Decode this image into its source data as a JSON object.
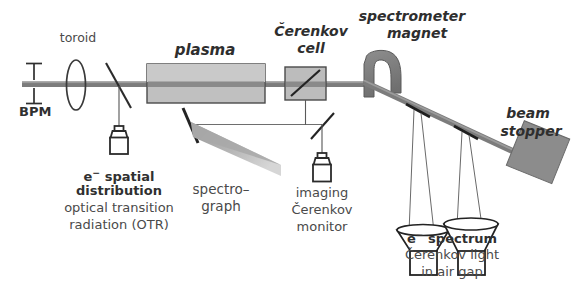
{
  "diagram": {
    "type": "schematic",
    "background_color": "#ffffff",
    "beamline_color": "#7a7a7a",
    "component_fill": "#b9b9b9",
    "outline_color": "#3a3a3a",
    "text_color": "#3b3b3b"
  },
  "labels": {
    "toroid": "toroid",
    "bpm": "BPM",
    "plasma": "plasma",
    "cerenkov_cell_line1": "Čerenkov",
    "cerenkov_cell_line2": "cell",
    "spectrometer_line1": "spectrometer",
    "spectrometer_line2": "magnet",
    "beam_stopper_line1": "beam",
    "beam_stopper_line2": "stopper",
    "otr_line1": "spatial",
    "otr_line1_prefix": "e",
    "otr_line1_sup": "−",
    "otr_line2": "distribution",
    "otr_line3": "optical transition",
    "otr_line4": "radiation (OTR)",
    "spectrograph_line1": "spectro–",
    "spectrograph_line2": "graph",
    "imaging_line1": "imaging",
    "imaging_line2": "Čerenkov",
    "imaging_line3": "monitor",
    "spectrum_prefix": "e",
    "spectrum_sup": "−",
    "spectrum_line1": "spectrum",
    "spectrum_line2": "Čerenkov light",
    "spectrum_line3": "in air gap",
    "bpm_symbol_top": "⊥",
    "bpm_symbol_bottom": "⊤"
  },
  "components": [
    {
      "name": "beam-position-monitor",
      "label": "BPM"
    },
    {
      "name": "toroid",
      "label": "toroid"
    },
    {
      "name": "otr-mirror",
      "label": "OTR mirror"
    },
    {
      "name": "otr-camera",
      "label": "e− spatial distribution camera"
    },
    {
      "name": "plasma-cell",
      "label": "plasma"
    },
    {
      "name": "spectrograph-mirror",
      "label": "spectrograph mirror"
    },
    {
      "name": "spectrograph-wedge",
      "label": "spectrograph"
    },
    {
      "name": "cerenkov-cell",
      "label": "Čerenkov cell"
    },
    {
      "name": "cerenkov-mirror",
      "label": "Čerenkov cell mirror"
    },
    {
      "name": "imaging-cerenkov-mirror",
      "label": "imaging Čerenkov mirror"
    },
    {
      "name": "imaging-cerenkov-camera",
      "label": "imaging Čerenkov monitor"
    },
    {
      "name": "spectrometer-magnet",
      "label": "spectrometer magnet"
    },
    {
      "name": "air-gap-detector-1",
      "label": "Čerenkov light detector 1"
    },
    {
      "name": "air-gap-detector-2",
      "label": "Čerenkov light detector 2"
    },
    {
      "name": "beam-stopper",
      "label": "beam stopper"
    }
  ]
}
